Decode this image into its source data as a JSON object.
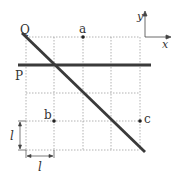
{
  "diagram": {
    "labels": {
      "line_q": "Q",
      "line_p": "P",
      "point_a": "a",
      "point_b": "b",
      "point_c": "c",
      "axis_x": "x",
      "axis_y": "y",
      "length_vertical": "l",
      "length_horizontal": "l"
    },
    "colors": {
      "grid": "#9a9a9a",
      "line": "#3a3a3a",
      "point": "#222222",
      "text": "#333333"
    }
  }
}
